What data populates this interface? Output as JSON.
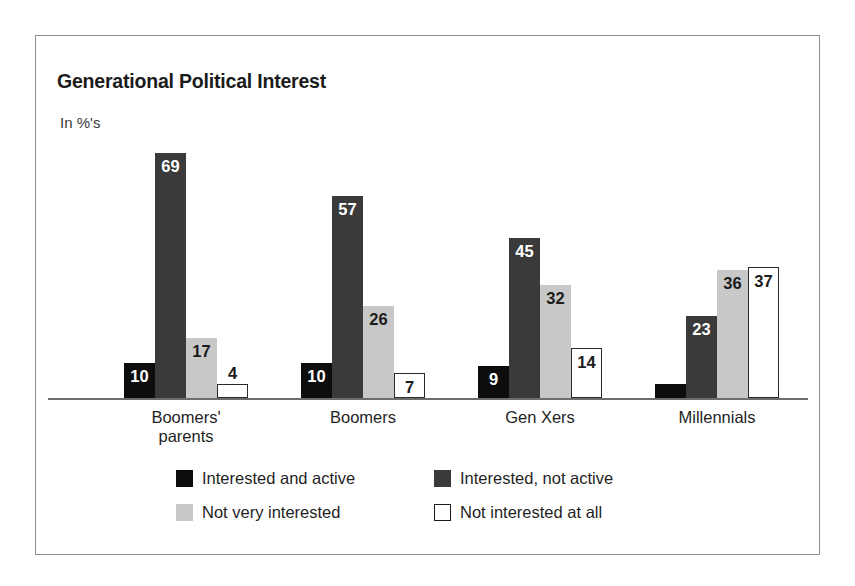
{
  "chart_data": {
    "type": "bar",
    "title": "Generational Political Interest",
    "subtitle": "In %'s",
    "xlabel": "",
    "ylabel": "",
    "ylim": [
      0,
      75
    ],
    "grid": false,
    "legend_position": "bottom",
    "categories": [
      "Boomers' parents",
      "Boomers",
      "Gen Xers",
      "Millennials"
    ],
    "category_lines": [
      [
        "Boomers'",
        "parents"
      ],
      [
        "Boomers"
      ],
      [
        "Gen Xers"
      ],
      [
        "Millennials"
      ]
    ],
    "series": [
      {
        "name": "Interested and active",
        "color": "#0d0d0d",
        "values": [
          10,
          10,
          9,
          4
        ]
      },
      {
        "name": "Interested, not active",
        "color": "#3a3a3a",
        "values": [
          69,
          57,
          45,
          23
        ]
      },
      {
        "name": "Not very interested",
        "color": "#c8c8c8",
        "values": [
          17,
          26,
          32,
          36
        ]
      },
      {
        "name": "Not interested at all",
        "color": "#ffffff",
        "values": [
          4,
          7,
          14,
          37
        ]
      }
    ],
    "data_labels": {
      "group_0": [
        "10",
        "69",
        "17",
        "4"
      ],
      "group_1": [
        "10",
        "57",
        "26",
        "7"
      ],
      "group_2": [
        "9",
        "45",
        "32",
        "14"
      ],
      "group_3": [
        "4",
        "23",
        "36",
        "37"
      ]
    },
    "label_placement": {
      "group_0": [
        "inside",
        "inside",
        "inside",
        "above"
      ],
      "group_1": [
        "inside",
        "inside",
        "inside",
        "inside"
      ],
      "group_2": [
        "inside",
        "inside",
        "inside",
        "inside"
      ],
      "group_3": [
        "above",
        "inside",
        "inside",
        "inside"
      ]
    }
  },
  "legend": {
    "rows": [
      [
        {
          "label": "Interested and active",
          "swatch": "black-swatch"
        },
        {
          "label": "Interested, not active",
          "swatch": "dark-gray-swatch"
        }
      ],
      [
        {
          "label": "Not very interested",
          "swatch": "light-gray-swatch"
        },
        {
          "label": "Not interested at all",
          "swatch": "white-swatch"
        }
      ]
    ]
  },
  "colors": {
    "series_0": "#0d0d0d",
    "series_1": "#3a3a3a",
    "series_2": "#c8c8c8",
    "series_3": "#ffffff",
    "frame": "#8e8e8e",
    "axis": "#6d6d6d",
    "text": "#1f1f1f"
  }
}
